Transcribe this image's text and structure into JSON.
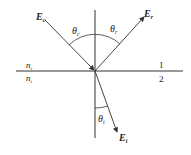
{
  "diagram": {
    "colors": {
      "line": "#333333",
      "background": "#ffffff"
    },
    "labels": {
      "incident_field": {
        "main": "E",
        "sub": "c"
      },
      "reflected_field": {
        "main": "E",
        "sub": "r"
      },
      "transmitted_field": {
        "main": "E",
        "sub": "t"
      },
      "incident_angle": {
        "main": "θ",
        "sub": "c"
      },
      "reflected_angle": {
        "main": "θ",
        "sub": "r"
      },
      "transmitted_angle": {
        "main": "θ",
        "sub": "t"
      },
      "index_upper": {
        "main": "n",
        "sub": "r"
      },
      "index_lower": {
        "main": "n",
        "sub": "t"
      },
      "medium_upper": "1",
      "medium_lower": "2"
    }
  }
}
